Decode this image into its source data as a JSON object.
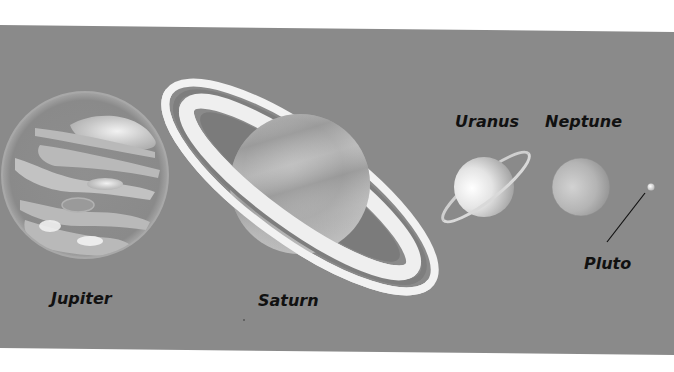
{
  "scene": {
    "title": "Outer planets of the solar system",
    "background_color": "#ffffff",
    "panel_color": "#8a8a8a"
  },
  "planets": [
    {
      "name": "Jupiter",
      "label": "Jupiter"
    },
    {
      "name": "Saturn",
      "label": "Saturn"
    },
    {
      "name": "Uranus",
      "label": "Uranus"
    },
    {
      "name": "Neptune",
      "label": "Neptune"
    },
    {
      "name": "Pluto",
      "label": "Pluto"
    }
  ]
}
